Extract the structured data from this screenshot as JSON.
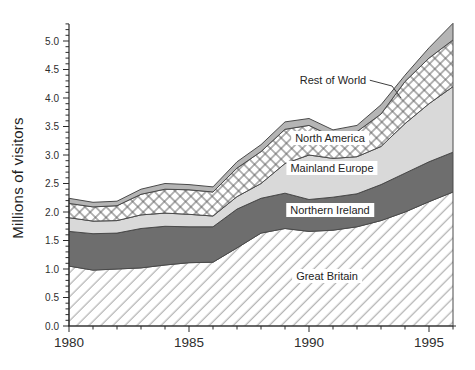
{
  "figure": {
    "background": "#ffffff",
    "y_axis_title": "Millions of visitors"
  },
  "labels": {
    "rest_of_world": "Rest of World",
    "north_america": "North America",
    "mainland_europe": "Mainland Europe",
    "northern_ireland": "Northern Ireland",
    "great_britain": "Great Britain"
  },
  "colors": {
    "northern_ireland_fill": "#6e6e6e",
    "mainland_europe_fill": "#d9d9d9",
    "rest_of_world_fill": "#b5b5b5",
    "band_outline": "#4a4a4a",
    "hatch_line": "#9f9f9f",
    "crosshatch_line": "#5a5a5a",
    "axis": "#2b2b2b"
  },
  "chart_data": {
    "type": "area",
    "stacked": true,
    "title": "",
    "xlabel": "",
    "ylabel": "Millions of visitors",
    "grid": false,
    "legend_position": "in-plot annotations",
    "x": [
      1980,
      1981,
      1982,
      1983,
      1984,
      1985,
      1986,
      1987,
      1988,
      1989,
      1990,
      1991,
      1992,
      1993,
      1994,
      1995,
      1996
    ],
    "xlim": [
      1980,
      1996
    ],
    "ylim": [
      0,
      5.3
    ],
    "x_major_ticks": [
      1980,
      1985,
      1990,
      1995
    ],
    "x_tick_labels": [
      "1980",
      "1985",
      "1990",
      "1995"
    ],
    "y_major_tick_step": 0.5,
    "y_minor_tick_step": 0.1,
    "y_tick_labels": [
      "0.0",
      "0.5",
      "1.0",
      "1.5",
      "2.0",
      "2.5",
      "3.0",
      "3.5",
      "4.0",
      "4.5",
      "5.0"
    ],
    "series": [
      {
        "name": "Great Britain",
        "fill": "diagonal-hatch",
        "values": [
          1.05,
          0.98,
          1.0,
          1.02,
          1.07,
          1.11,
          1.12,
          1.37,
          1.63,
          1.71,
          1.66,
          1.68,
          1.74,
          1.85,
          2.0,
          2.18,
          2.35
        ]
      },
      {
        "name": "Northern Ireland",
        "fill": "#6e6e6e",
        "values": [
          0.61,
          0.64,
          0.63,
          0.69,
          0.68,
          0.63,
          0.62,
          0.68,
          0.61,
          0.62,
          0.56,
          0.58,
          0.58,
          0.63,
          0.68,
          0.7,
          0.7
        ]
      },
      {
        "name": "Mainland Europe",
        "fill": "#d9d9d9",
        "values": [
          0.24,
          0.22,
          0.22,
          0.24,
          0.23,
          0.22,
          0.19,
          0.22,
          0.26,
          0.52,
          0.78,
          0.68,
          0.65,
          0.67,
          0.87,
          1.02,
          1.15
        ]
      },
      {
        "name": "North America",
        "fill": "crosshatch",
        "values": [
          0.25,
          0.25,
          0.26,
          0.36,
          0.42,
          0.43,
          0.42,
          0.5,
          0.56,
          0.6,
          0.52,
          0.38,
          0.44,
          0.57,
          0.74,
          0.8,
          0.82
        ]
      },
      {
        "name": "Rest of World",
        "fill": "#b5b5b5",
        "values": [
          0.09,
          0.08,
          0.08,
          0.09,
          0.1,
          0.09,
          0.09,
          0.11,
          0.12,
          0.13,
          0.12,
          0.12,
          0.11,
          0.16,
          0.11,
          0.18,
          0.29
        ]
      }
    ],
    "totals": [
      2.24,
      2.17,
      2.19,
      2.4,
      2.5,
      2.48,
      2.44,
      2.88,
      3.18,
      3.58,
      3.64,
      3.44,
      3.52,
      3.88,
      4.4,
      4.88,
      5.31
    ]
  }
}
